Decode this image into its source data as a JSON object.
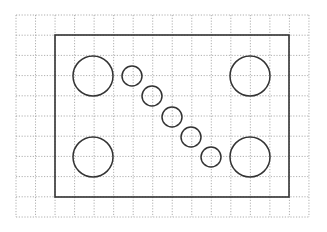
{
  "diagram": {
    "type": "grid-drawing",
    "colors": {
      "background": "#ffffff",
      "grid": "#9a9a9a",
      "outline": "#333333"
    },
    "grid": {
      "x0": 16,
      "y0": 15,
      "cols": 15,
      "rows": 10,
      "cell_w": 19.53,
      "cell_h": 20.2
    },
    "rectangle": {
      "x": 55,
      "y": 35,
      "width": 234,
      "height": 162
    },
    "large_circles": [
      {
        "name": "top-left",
        "cx": 93,
        "cy": 76,
        "r": 20
      },
      {
        "name": "top-right",
        "cx": 250,
        "cy": 76,
        "r": 20
      },
      {
        "name": "bottom-left",
        "cx": 93,
        "cy": 157,
        "r": 20
      },
      {
        "name": "bottom-right",
        "cx": 250,
        "cy": 157,
        "r": 20
      }
    ],
    "small_circles": [
      {
        "cx": 132,
        "cy": 76,
        "r": 10
      },
      {
        "cx": 152,
        "cy": 96,
        "r": 10
      },
      {
        "cx": 172,
        "cy": 117,
        "r": 10
      },
      {
        "cx": 191,
        "cy": 137,
        "r": 10
      },
      {
        "cx": 211,
        "cy": 157,
        "r": 10
      }
    ]
  }
}
